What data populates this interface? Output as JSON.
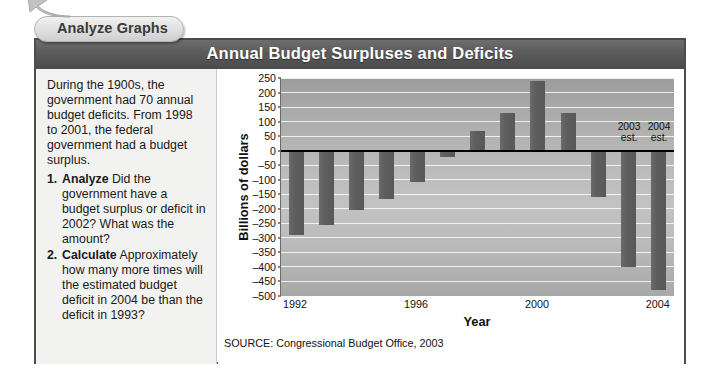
{
  "tab": {
    "label": "Analyze Graphs",
    "arrow_icon": "arrow-up-left-icon"
  },
  "header": {
    "title": "Annual Budget Surpluses and Deficits"
  },
  "text_panel": {
    "intro": "During the 1900s, the government had 70 annual budget deficits. From 1998 to 2001, the federal government had a budget surplus.",
    "questions": [
      {
        "number": "1.",
        "lead": "Analyze",
        "body": " Did the government have a budget surplus or deficit in 2002? What was the amount?"
      },
      {
        "number": "2.",
        "lead": "Calculate",
        "body": " Approximately how many more times will the estimated budget deficit in 2004 be than the deficit in 1993?"
      }
    ]
  },
  "source": "SOURCE: Congressional Budget Office, 2003",
  "colors": {
    "header_bar": "#5c5c5c",
    "bar_fill": "#5e5e5e",
    "plot_bg": "#bdbdbd",
    "gridline": "#ffffff",
    "zero_line": "#000000",
    "panel_bg": "#f2f2f0",
    "frame_border": "#4d4d4d"
  },
  "chart_data": {
    "type": "bar",
    "title": "Annual Budget Surpluses and Deficits",
    "xlabel": "Year",
    "ylabel": "Billions of dollars",
    "ylim": [
      -500,
      250
    ],
    "ytick_values": [
      250,
      200,
      150,
      100,
      50,
      0,
      -50,
      -100,
      -150,
      -200,
      -250,
      -300,
      -350,
      -400,
      -450,
      -500
    ],
    "ytick_labels": [
      "250",
      "200",
      "150",
      "100",
      "50",
      "0",
      "–50",
      "–100",
      "–150",
      "–200",
      "–250",
      "–300",
      "–350",
      "–400",
      "–450",
      "–500"
    ],
    "xtick_labels": [
      "1992",
      "1996",
      "2000",
      "2004"
    ],
    "xtick_categories": [
      "1992",
      "1996",
      "2000",
      "2004"
    ],
    "grid": true,
    "legend": "none",
    "categories": [
      "1992",
      "1993",
      "1994",
      "1995",
      "1996",
      "1997",
      "1998",
      "1999",
      "2000",
      "2001",
      "2002",
      "2003",
      "2004"
    ],
    "values": [
      -290,
      -255,
      -203,
      -165,
      -108,
      -22,
      68,
      128,
      240,
      128,
      -158,
      -401,
      -480
    ],
    "annotations": [
      {
        "label": "2003\nest.",
        "category": "2003"
      },
      {
        "label": "2004\nest.",
        "category": "2004"
      }
    ]
  }
}
